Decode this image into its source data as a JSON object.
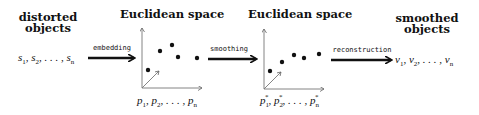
{
  "stages": {
    "input": {
      "title_line1": "distorted",
      "title_line2": "objects",
      "sequence": "s1, s2, ..., sn"
    },
    "embedded": {
      "title": "Euclidean space",
      "sequence": "p1, p2, ..., pn"
    },
    "smoothed_space": {
      "title": "Euclidean space",
      "sequence": "p1*, p2*, ..., pn*"
    },
    "output": {
      "title_line1": "smoothed",
      "title_line2": "objects",
      "sequence": "v1, v2, ..., vn"
    }
  },
  "arrows": {
    "embedding": "embedding",
    "smoothing": "smoothing",
    "reconstruction": "reconstruction"
  },
  "plots": {
    "embedded_points": [
      [
        8,
        42
      ],
      [
        20,
        22
      ],
      [
        32,
        15
      ],
      [
        36,
        28
      ],
      [
        55,
        30
      ]
    ],
    "smoothed_points": [
      [
        8,
        42
      ],
      [
        22,
        34
      ],
      [
        36,
        24
      ],
      [
        48,
        28
      ],
      [
        62,
        23
      ]
    ]
  }
}
